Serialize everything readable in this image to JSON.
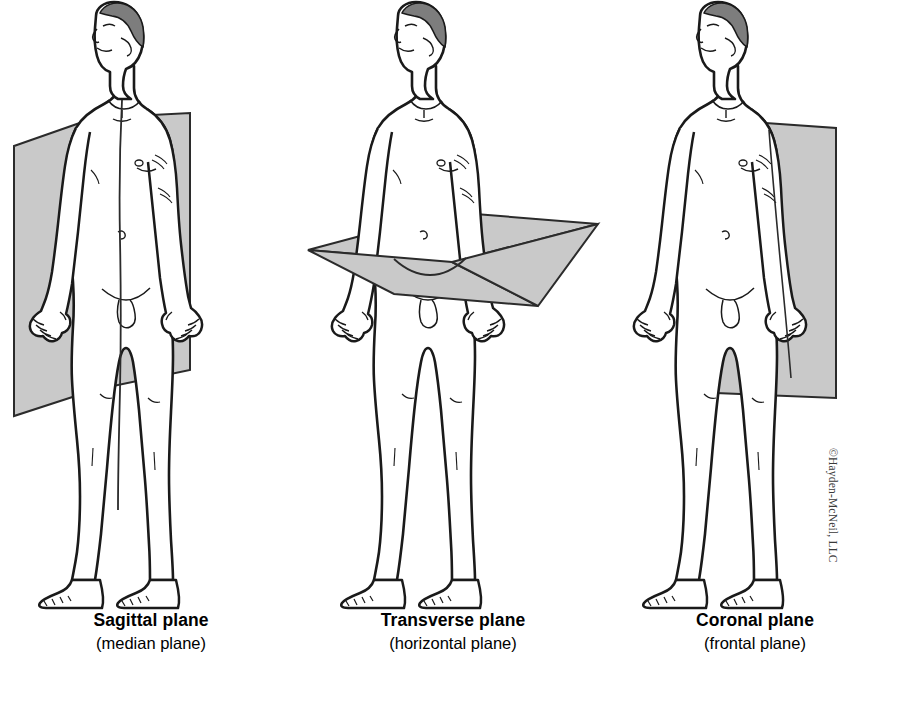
{
  "diagram": {
    "background_color": "#ffffff",
    "plane_fill_color": "#c9c9c9",
    "plane_stroke_color": "#2b2b2b",
    "body_outline_color": "#1a1a1a",
    "body_fill_color": "#ffffff",
    "hair_shade_color": "#7d7d7d"
  },
  "panels": [
    {
      "id": "sagittal",
      "plane_name": "sagittal-plane",
      "plane_orientation": "vertical, front-to-back, through the midline",
      "caption_primary": "Sagittal plane",
      "caption_secondary": "(median plane)",
      "figure_name": "human-body-figure"
    },
    {
      "id": "transverse",
      "plane_name": "transverse-plane",
      "plane_orientation": "horizontal, at waist level",
      "caption_primary": "Transverse plane",
      "caption_secondary": "(horizontal plane)",
      "figure_name": "human-body-figure"
    },
    {
      "id": "coronal",
      "plane_name": "coronal-plane",
      "plane_orientation": "vertical, left-to-right, through the body",
      "caption_primary": "Coronal plane",
      "caption_secondary": "(frontal plane)",
      "figure_name": "human-body-figure"
    }
  ],
  "copyright": {
    "text": "©Hayden-McNeil, LLC"
  }
}
